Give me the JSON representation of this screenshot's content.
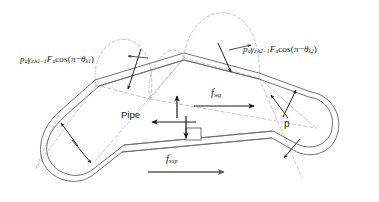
{
  "figure": {
    "background_color": "#ffffff",
    "line_color": "#555555",
    "arrow_color": "#1a1a1a",
    "arrow_color_secondary": "#5a5a5a",
    "dashed_color": "#b4b4b4"
  },
  "labels": {
    "left_formula": {
      "name": "left-wall-force-formula",
      "p": "p",
      "p_sub": "a",
      "gamma": "γ",
      "gamma_sub": "z,k1−1",
      "F": "F",
      "F_sub": "a",
      "cos": "cos",
      "open": "(",
      "pi": "π",
      "minus": "−",
      "theta": "θ",
      "theta_sub": "k1",
      "close": ")",
      "full_text": "p_a γ_z,k1−1 F_a cos(π − θ_k1)"
    },
    "right_formula": {
      "name": "right-wall-force-formula",
      "p": "p",
      "p_sub": "a",
      "gamma": "γ",
      "gamma_sub": "z,k2−1",
      "F": "F",
      "F_sub": "a",
      "cos": "cos",
      "open": "(",
      "pi": "π",
      "minus": "−",
      "theta": "θ",
      "theta_sub": "k2",
      "close": ")",
      "full_text": "p_a γ_z,k2−1 F_a cos(π − θ_k2)"
    },
    "pipe": "Pipe",
    "pressure": "p",
    "f_wg": {
      "symbol": "f",
      "subscript": "wg",
      "full_text": "f_wg"
    },
    "f_sup": {
      "symbol": "f",
      "subscript": "sup",
      "full_text": "f_sup"
    }
  }
}
